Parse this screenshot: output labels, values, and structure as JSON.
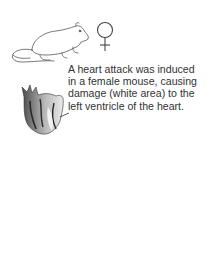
{
  "figure": {
    "icons": {
      "mouse": "mouse-illustration",
      "female_symbol": "♀",
      "heart": "heart-illustration"
    },
    "caption_lines": [
      "A heart attack was induced",
      "in a female mouse, causing",
      "damage (white area) to the",
      "left ventricle of the heart."
    ],
    "colors": {
      "text": "#333333",
      "line_art": "#555555",
      "heart_dark": "#3a3a3a",
      "heart_mid": "#8a8a8a",
      "heart_light": "#e6e6e6"
    }
  }
}
